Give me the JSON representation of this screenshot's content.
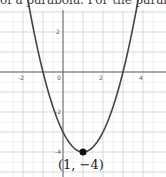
{
  "caption_fragment": "of a parabola. For the parabola",
  "chart_data": {
    "type": "line",
    "title": "",
    "function": "y = (x - 1)^2 - 4",
    "xlabel": "",
    "ylabel": "",
    "xlim": [
      -2.5,
      4.5
    ],
    "ylim": [
      -5,
      3
    ],
    "x_ticks": [
      "-2",
      "0",
      "2",
      "4"
    ],
    "y_ticks": [
      "2",
      "-2",
      "-4"
    ],
    "grid": true,
    "grid_step": 0.5,
    "vertex": {
      "x": 1,
      "y": -4,
      "label": "(1, −4)"
    },
    "series": [
      {
        "name": "parabola",
        "x": [
          -1.8,
          -1,
          0,
          1,
          2,
          3,
          3.8
        ],
        "y": [
          3.84,
          0,
          -3,
          -4,
          -3,
          0,
          3.84
        ]
      }
    ]
  }
}
